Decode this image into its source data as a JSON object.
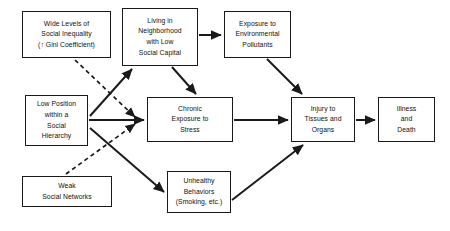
{
  "figure": {
    "background_color": "#ffffff",
    "line_color": "#1a1a1a",
    "text_color": "#111111"
  },
  "nodes": [
    {
      "id": "wide-levels-social-inequality",
      "lines": [
        "Wide Levels of",
        "Social Inequality",
        "(↑ Gini Coefficient)"
      ],
      "x": 22,
      "y": 11,
      "w": 89,
      "h": 47
    },
    {
      "id": "living-in-neighborhood",
      "lines": [
        "Living in",
        "Neighborhood",
        "with Low",
        "Social Capital"
      ],
      "x": 122,
      "y": 8,
      "w": 76,
      "h": 58
    },
    {
      "id": "exposure-environmental-pollutants",
      "lines": [
        "Exposure to",
        "Environmental",
        "Pollutants"
      ],
      "x": 224,
      "y": 11,
      "w": 67,
      "h": 47
    },
    {
      "id": "low-position-social-hierarchy",
      "lines": [
        "Low Position",
        "within a",
        "Social",
        "Hierarchy"
      ],
      "x": 25,
      "y": 95,
      "w": 63,
      "h": 51
    },
    {
      "id": "chronic-exposure-stress",
      "lines": [
        "Chronic",
        "Exposure to",
        "Stress"
      ],
      "x": 147,
      "y": 97,
      "w": 86,
      "h": 45
    },
    {
      "id": "injury-tissues-organs",
      "lines": [
        "Injury to",
        "Tissues and",
        "Organs"
      ],
      "x": 291,
      "y": 97,
      "w": 64,
      "h": 45
    },
    {
      "id": "illness-and-death",
      "lines": [
        "Illness",
        "and",
        "Death"
      ],
      "x": 378,
      "y": 97,
      "w": 57,
      "h": 45
    },
    {
      "id": "weak-social-networks",
      "lines": [
        "Weak",
        "Social Networks"
      ],
      "x": 22,
      "y": 176,
      "w": 90,
      "h": 31
    },
    {
      "id": "unhealthy-behaviors",
      "lines": [
        "Unhealthy",
        "Behaviors",
        "(Smoking, etc.)"
      ],
      "x": 167,
      "y": 171,
      "w": 64,
      "h": 42
    }
  ],
  "edges": [
    {
      "id": "neighborhood-to-pollutants",
      "from": "living-in-neighborhood",
      "to": "exposure-environmental-pollutants",
      "style": "solid",
      "path": "M 199,35 L 221,35"
    },
    {
      "id": "neighborhood-to-stress",
      "from": "living-in-neighborhood",
      "to": "chronic-exposure-stress",
      "style": "solid",
      "path": "M 172,67 L 196,94"
    },
    {
      "id": "pollutants-to-injury",
      "from": "exposure-environmental-pollutants",
      "to": "injury-tissues-organs",
      "style": "solid",
      "path": "M 267,59 L 302,94"
    },
    {
      "id": "low-position-to-neighborhood",
      "from": "low-position-social-hierarchy",
      "to": "living-in-neighborhood",
      "style": "solid",
      "path": "M 90,116 L 132,69"
    },
    {
      "id": "low-position-to-stress",
      "from": "low-position-social-hierarchy",
      "to": "chronic-exposure-stress",
      "style": "solid",
      "path": "M 89,120 L 144,120"
    },
    {
      "id": "low-position-to-unhealthy-behaviors",
      "from": "low-position-social-hierarchy",
      "to": "unhealthy-behaviors",
      "style": "solid",
      "path": "M 90,128 L 164,192"
    },
    {
      "id": "stress-to-injury",
      "from": "chronic-exposure-stress",
      "to": "injury-tissues-organs",
      "style": "solid",
      "path": "M 234,120 L 288,120"
    },
    {
      "id": "unhealthy-behaviors-to-injury",
      "from": "unhealthy-behaviors",
      "to": "injury-tissues-organs",
      "style": "solid",
      "path": "M 232,200 L 303,145"
    },
    {
      "id": "injury-to-illness-death",
      "from": "injury-tissues-organs",
      "to": "illness-and-death",
      "style": "solid",
      "path": "M 356,120 L 375,120"
    },
    {
      "id": "inequality-to-stress-dashed",
      "from": "wide-levels-social-inequality",
      "to": "chronic-exposure-stress",
      "style": "dashed",
      "path": "M 75,60 L 135,117"
    },
    {
      "id": "weak-networks-to-stress-dashed",
      "from": "weak-social-networks",
      "to": "chronic-exposure-stress",
      "style": "dashed",
      "path": "M 66,174 L 135,124"
    }
  ]
}
